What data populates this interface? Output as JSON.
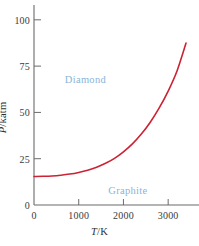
{
  "figure": {
    "background_color": "#ffffff",
    "axis_color": "#6b6b6b",
    "text_color": "#3b3b3b"
  },
  "axes": {
    "y_title": {
      "symbol": "P",
      "rest": "/katm"
    },
    "x_title": {
      "symbol": "T",
      "rest": "/K"
    }
  },
  "labels": {
    "diamond": {
      "text": "Diamond",
      "color": "#8ab4d8",
      "x_value": 1150,
      "y_value": 68
    },
    "graphite": {
      "text": "Graphite",
      "color": "#8ab4d8",
      "x_value": 2100,
      "y_value": 8
    }
  },
  "chart_data": {
    "type": "line",
    "title": "",
    "subtitle": "",
    "xlabel": "T/K",
    "ylabel": "P/katm",
    "xlim": [
      0,
      3600
    ],
    "ylim": [
      0,
      108
    ],
    "xticks": [
      0,
      1000,
      2000,
      3000
    ],
    "xtick_labels": [
      "0",
      "1000",
      "2000",
      "3000"
    ],
    "yticks": [
      0,
      25,
      50,
      75,
      100
    ],
    "ytick_labels": [
      "0",
      "25",
      "50",
      "75",
      "100"
    ],
    "grid": false,
    "legend": false,
    "tick_direction": "in",
    "annotations": [
      {
        "text": "Diamond",
        "x": 1150,
        "y": 68,
        "color": "#8ab4d8"
      },
      {
        "text": "Graphite",
        "x": 2100,
        "y": 8,
        "color": "#8ab4d8"
      }
    ],
    "series": [
      {
        "name": "graphite-diamond phase boundary",
        "color": "#cc2233",
        "width": 1.6,
        "x": [
          0,
          200,
          400,
          600,
          800,
          1000,
          1200,
          1400,
          1600,
          1800,
          2000,
          2200,
          2400,
          2600,
          2800,
          3000,
          3200,
          3400
        ],
        "y": [
          15.4,
          15.5,
          15.7,
          16.1,
          16.7,
          17.6,
          18.8,
          20.4,
          22.5,
          25.2,
          28.7,
          33.0,
          38.3,
          44.7,
          52.4,
          61.5,
          72.5,
          87.5
        ]
      }
    ]
  }
}
